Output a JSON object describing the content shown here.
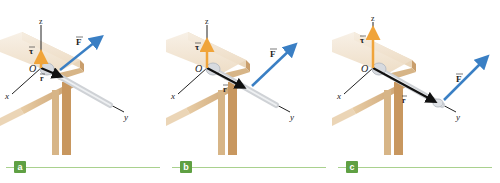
{
  "figure": {
    "panels": [
      {
        "id": "a",
        "badge": "a",
        "axes": {
          "x": "x",
          "y": "y",
          "z": "z",
          "origin": "O"
        },
        "vectors": {
          "force": {
            "label": "F",
            "color": "#3a7fc4"
          },
          "torque": {
            "label": "τ",
            "color": "#f0a43a",
            "relative_length": "short"
          },
          "position": {
            "label": "r",
            "color": "#111111",
            "relative_length": "short"
          }
        }
      },
      {
        "id": "b",
        "badge": "b",
        "axes": {
          "x": "x",
          "y": "y",
          "z": "z",
          "origin": "O"
        },
        "vectors": {
          "force": {
            "label": "F",
            "color": "#3a7fc4"
          },
          "torque": {
            "label": "τ",
            "color": "#f0a43a",
            "relative_length": "medium"
          },
          "position": {
            "label": "r",
            "color": "#111111",
            "relative_length": "medium"
          }
        }
      },
      {
        "id": "c",
        "badge": "c",
        "axes": {
          "x": "x",
          "y": "y",
          "z": "z",
          "origin": "O"
        },
        "vectors": {
          "force": {
            "label": "F",
            "color": "#3a7fc4"
          },
          "torque": {
            "label": "τ",
            "color": "#f0a43a",
            "relative_length": "long"
          },
          "position": {
            "label": "r",
            "color": "#111111",
            "relative_length": "long"
          }
        }
      }
    ],
    "colors": {
      "caption_line": "#a9d18e",
      "badge_bg": "#5fa043",
      "table_wood": "#d9b98c",
      "table_top": "#f3e6d3"
    }
  }
}
